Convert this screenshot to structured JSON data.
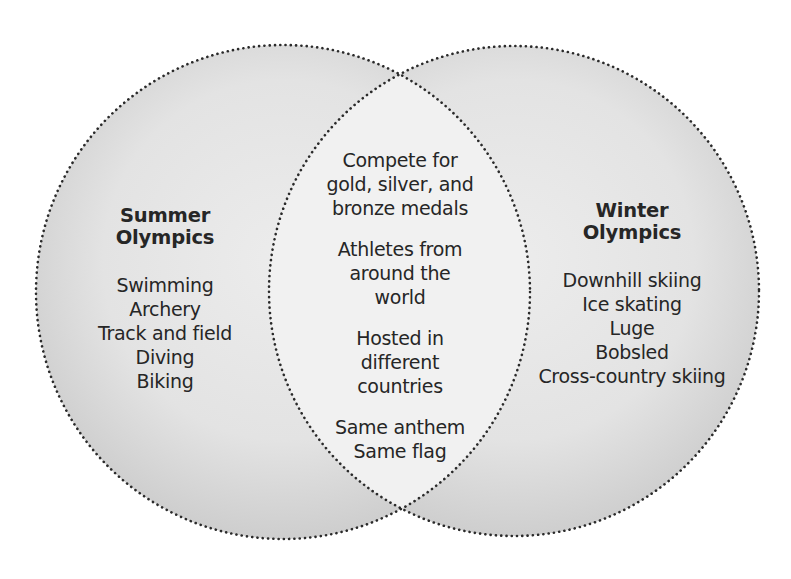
{
  "diagram": {
    "type": "venn",
    "colors": {
      "background": "#ffffff",
      "set_fill_light": "#e8e8e8",
      "set_fill_dark": "#cfcfcf",
      "intersection_fill": "#f1f1f1",
      "outline": "#2a2a2a",
      "text": "#222222"
    },
    "left_set": {
      "title_line1": "Summer",
      "title_line2": "Olympics",
      "items": [
        "Swimming",
        "Archery",
        "Track and field",
        "Diving",
        "Biking"
      ]
    },
    "right_set": {
      "title_line1": "Winter",
      "title_line2": "Olympics",
      "items": [
        "Downhill skiing",
        "Ice skating",
        "Luge",
        "Bobsled",
        "Cross-country skiing"
      ]
    },
    "intersection": {
      "groups": [
        [
          "Compete for",
          "gold, silver, and",
          "bronze medals"
        ],
        [
          "Athletes from",
          "around the",
          "world"
        ],
        [
          "Hosted in",
          "different",
          "countries"
        ],
        [
          "Same anthem",
          "Same flag"
        ]
      ]
    }
  }
}
